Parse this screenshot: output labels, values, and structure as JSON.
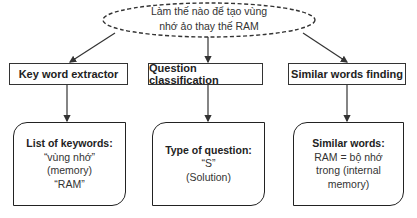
{
  "question": {
    "line1": "Làm thế nào để tạo vùng",
    "line2": "nhớ ảo thay thế RAM"
  },
  "processes": [
    {
      "label": "Key word extractor"
    },
    {
      "label": "Question classification"
    },
    {
      "label": "Similar words finding"
    }
  ],
  "results": [
    {
      "heading": "List of keywords:",
      "lines": [
        "“vùng nhớ”",
        "(memory)",
        "“RAM”"
      ]
    },
    {
      "heading": "Type of question:",
      "lines": [
        "“S”",
        "(Solution)"
      ]
    },
    {
      "heading": "Similar words:",
      "lines": [
        "RAM = bộ nhớ",
        "trong (internal",
        "memory)"
      ]
    }
  ],
  "colors": {
    "stroke": "#333333",
    "text": "#222222",
    "background": "#ffffff"
  }
}
